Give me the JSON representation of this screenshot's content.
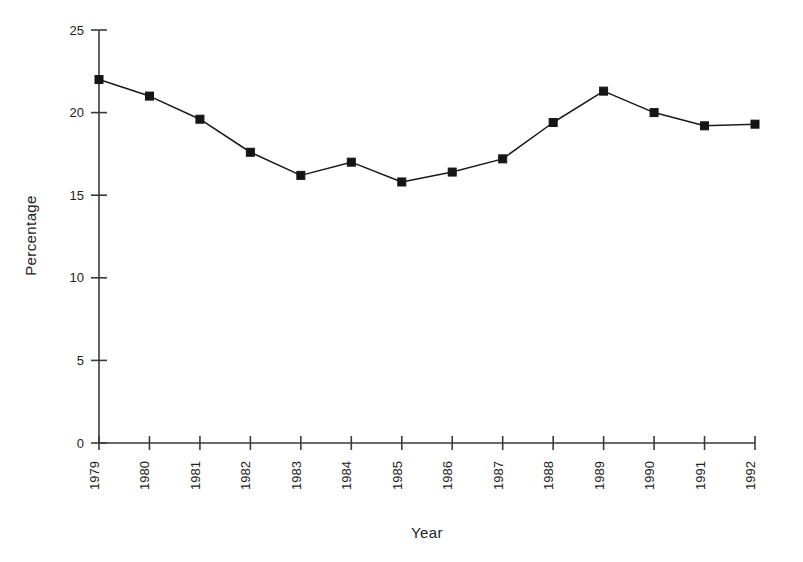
{
  "chart_data": {
    "type": "line",
    "title": "",
    "xlabel": "Year",
    "ylabel": "Percentage",
    "categories": [
      "1979",
      "1980",
      "1981",
      "1982",
      "1983",
      "1984",
      "1985",
      "1986",
      "1987",
      "1988",
      "1989",
      "1990",
      "1991",
      "1992"
    ],
    "values": [
      22.0,
      21.0,
      19.6,
      17.6,
      16.2,
      17.0,
      15.8,
      16.4,
      17.2,
      19.4,
      21.3,
      20.0,
      19.2,
      19.3
    ],
    "series": [
      {
        "name": "Percentage",
        "values": [
          22.0,
          21.0,
          19.6,
          17.6,
          16.2,
          17.0,
          15.8,
          16.4,
          17.2,
          19.4,
          21.3,
          20.0,
          19.2,
          19.3
        ]
      }
    ],
    "ylim": [
      0,
      25
    ],
    "yticks": [
      "0",
      "5",
      "10",
      "15",
      "20",
      "25"
    ],
    "ytick_values": [
      0,
      5,
      10,
      15,
      20,
      25
    ],
    "xtick_labels": [
      "1979",
      "1980",
      "1981",
      "1982",
      "1983",
      "1984",
      "1985",
      "1986",
      "1987",
      "1988",
      "1989",
      "1990",
      "1991",
      "1992"
    ],
    "xtick_rotation": -90,
    "grid": false,
    "legend": false,
    "legend_position": "none",
    "marker": "square",
    "line_color": "#1a1a1a",
    "marker_color": "#151515",
    "background_color": "#ffffff",
    "axis_color": "#3a3a3a"
  }
}
